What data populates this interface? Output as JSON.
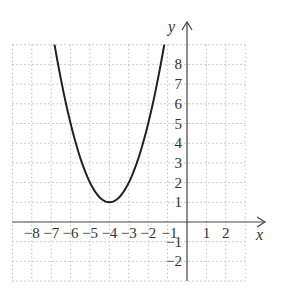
{
  "chart_data": {
    "type": "line",
    "title": "",
    "xlabel": "x",
    "ylabel": "y",
    "xlim": [
      -9,
      3
    ],
    "ylim": [
      -3,
      9
    ],
    "grid": true,
    "x_tick_labels": [
      "-8",
      "-7",
      "-6",
      "-5",
      "-4",
      "-3",
      "-2",
      "-1",
      "1",
      "2"
    ],
    "y_tick_labels": [
      "8",
      "7",
      "6",
      "5",
      "4",
      "3",
      "2",
      "1",
      "-1",
      "-2"
    ],
    "series": [
      {
        "name": "parabola",
        "equation": "y = (x + 4)^2 + 1",
        "vertex": [
          -4,
          1
        ],
        "x": [
          -6.83,
          -6,
          -5,
          -4,
          -3,
          -2,
          -1.17
        ],
        "y": [
          9,
          5,
          2,
          1,
          2,
          5,
          9
        ]
      }
    ]
  }
}
